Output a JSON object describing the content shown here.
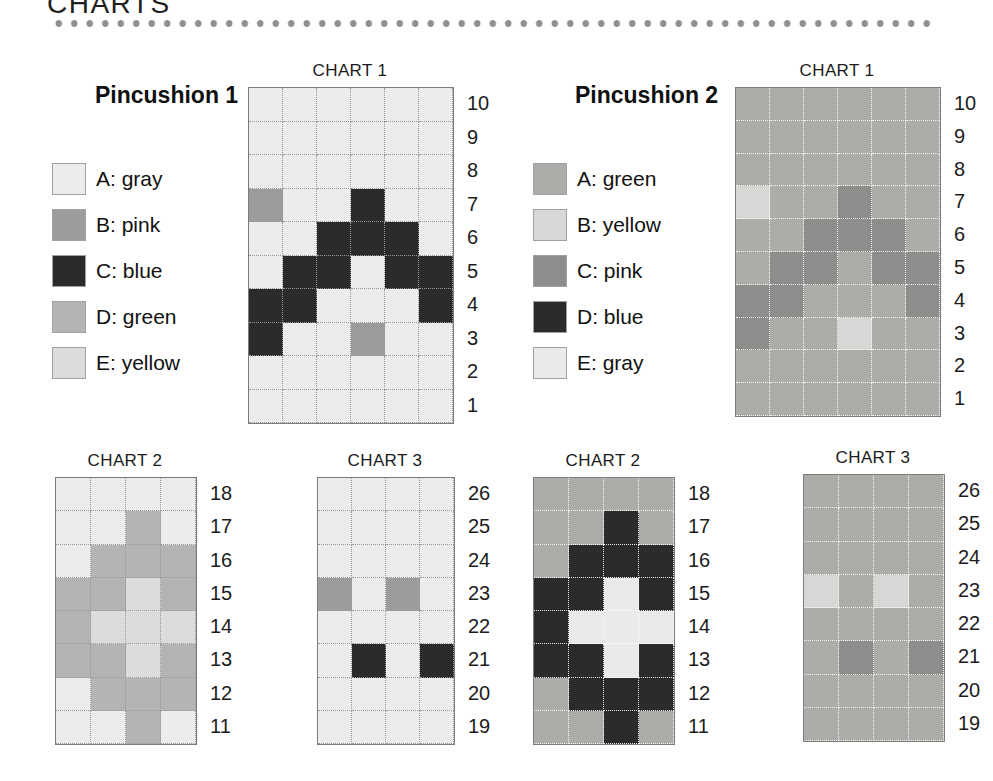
{
  "page": {
    "title": "CHARTS"
  },
  "pincushions": [
    {
      "name": "Pincushion 1",
      "palette": {
        "A": "#ecedeb",
        "B": "#9b9d9a",
        "C": "#2b2b2b",
        "D": "#b3b5b2",
        "E": "#dcddda"
      },
      "legend": [
        {
          "letter": "A",
          "label": "A: gray"
        },
        {
          "letter": "B",
          "label": "B: pink"
        },
        {
          "letter": "C",
          "label": "C: blue"
        },
        {
          "letter": "D",
          "label": "D: green"
        },
        {
          "letter": "E",
          "label": "E: yellow"
        }
      ],
      "charts": [
        {
          "title": "CHART 1",
          "row_numbers": [
            10,
            9,
            8,
            7,
            6,
            5,
            4,
            3,
            2,
            1
          ],
          "rows": [
            "AAAAAA",
            "AAAAAA",
            "AAAAAA",
            "BAACAA",
            "AACCCA",
            "ACCACC",
            "CCAAAC",
            "CAABAA",
            "AAAAAA",
            "AAAAAA"
          ]
        },
        {
          "title": "CHART 2",
          "row_numbers": [
            18,
            17,
            16,
            15,
            14,
            13,
            12,
            11
          ],
          "rows": [
            "AAAA",
            "AADA",
            "ADDD",
            "DDED",
            "DEEE",
            "DDED",
            "ADDD",
            "AADA"
          ]
        },
        {
          "title": "CHART 3",
          "row_numbers": [
            26,
            25,
            24,
            23,
            22,
            21,
            20,
            19
          ],
          "rows": [
            "AAAA",
            "AAAA",
            "AAAA",
            "BABA",
            "AAAA",
            "ACAC",
            "AAAA",
            "AAAA"
          ]
        }
      ]
    },
    {
      "name": "Pincushion 2",
      "palette": {
        "A": "#abada9",
        "B": "#d7d8d5",
        "C": "#8c8e8b",
        "D": "#2b2b2b",
        "E": "#eaebe9"
      },
      "legend": [
        {
          "letter": "A",
          "label": "A: green"
        },
        {
          "letter": "B",
          "label": "B: yellow"
        },
        {
          "letter": "C",
          "label": "C: pink"
        },
        {
          "letter": "D",
          "label": "D: blue"
        },
        {
          "letter": "E",
          "label": "E: gray"
        }
      ],
      "charts": [
        {
          "title": "CHART 1",
          "row_numbers": [
            10,
            9,
            8,
            7,
            6,
            5,
            4,
            3,
            2,
            1
          ],
          "rows": [
            "AAAAAA",
            "AAAAAA",
            "AAAAAA",
            "BAACAA",
            "AACCCA",
            "ACCACC",
            "CCAAAC",
            "CAABAA",
            "AAAAAA",
            "AAAAAA"
          ]
        },
        {
          "title": "CHART 2",
          "row_numbers": [
            18,
            17,
            16,
            15,
            14,
            13,
            12,
            11
          ],
          "rows": [
            "AAAA",
            "AADA",
            "ADDD",
            "DDED",
            "DEEE",
            "DDED",
            "ADDD",
            "AADA"
          ]
        },
        {
          "title": "CHART 3",
          "row_numbers": [
            26,
            25,
            24,
            23,
            22,
            21,
            20,
            19
          ],
          "rows": [
            "AAAA",
            "AAAA",
            "AAAA",
            "BABA",
            "AAAA",
            "ACAC",
            "AAAA",
            "AAAA"
          ]
        }
      ]
    }
  ]
}
